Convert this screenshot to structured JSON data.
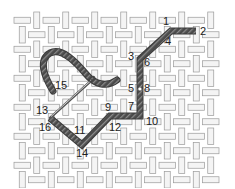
{
  "diagram": {
    "title": "",
    "type": "embroidery-stitch-diagram",
    "canvas": {
      "weave": "basket-weave",
      "thread_fill": "#f4f4f4",
      "thread_stroke": "#9a9a9a",
      "background": "#ffffff",
      "x0": 15,
      "y0": 13,
      "cols": 14,
      "rows": 12,
      "cell": 14.5
    },
    "stitch_thread": {
      "color": "#4a4a4a",
      "highlight": "#8a8a8a",
      "width": 6
    },
    "needle": {
      "color": "#555555"
    },
    "points": [
      {
        "label": "1",
        "x": 163,
        "y": 25
      },
      {
        "label": "2",
        "x": 200,
        "y": 35
      },
      {
        "label": "3",
        "x": 128,
        "y": 60
      },
      {
        "label": "4",
        "x": 165,
        "y": 45
      },
      {
        "label": "5",
        "x": 128,
        "y": 92
      },
      {
        "label": "6",
        "x": 144,
        "y": 66
      },
      {
        "label": "7",
        "x": 128,
        "y": 110
      },
      {
        "label": "8",
        "x": 144,
        "y": 92
      },
      {
        "label": "9",
        "x": 105,
        "y": 111
      },
      {
        "label": "10",
        "x": 146,
        "y": 125
      },
      {
        "label": "11",
        "x": 74,
        "y": 134
      },
      {
        "label": "12",
        "x": 109,
        "y": 131
      },
      {
        "label": "13",
        "x": 36,
        "y": 114
      },
      {
        "label": "14",
        "x": 76,
        "y": 157
      },
      {
        "label": "15",
        "x": 55,
        "y": 89
      },
      {
        "label": "16",
        "x": 39,
        "y": 131
      }
    ]
  }
}
